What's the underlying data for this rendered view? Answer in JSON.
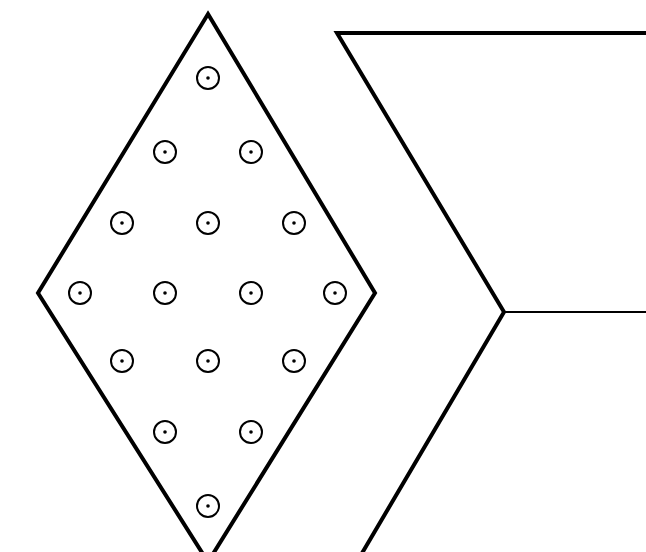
{
  "canvas": {
    "width": 646,
    "height": 552,
    "background": "#ffffff"
  },
  "colors": {
    "stroke": "#000000",
    "fill": "#ffffff"
  },
  "diamond": {
    "vertices": [
      [
        208,
        14
      ],
      [
        375,
        293
      ],
      [
        208,
        562
      ],
      [
        38,
        293
      ]
    ],
    "stroke_width": 4
  },
  "chevron": {
    "outer_path": [
      [
        646,
        33
      ],
      [
        337,
        33
      ],
      [
        504,
        312
      ],
      [
        358,
        560
      ]
    ],
    "stroke_width": 4,
    "divider": {
      "from": [
        504,
        312
      ],
      "to": [
        646,
        312
      ],
      "stroke_width": 2
    }
  },
  "circles": {
    "radius": 11,
    "dot_radius": 1.8,
    "stroke_width": 2,
    "positions": [
      [
        208,
        78
      ],
      [
        165,
        152
      ],
      [
        251,
        152
      ],
      [
        122,
        223
      ],
      [
        208,
        223
      ],
      [
        294,
        223
      ],
      [
        80,
        293
      ],
      [
        165,
        293
      ],
      [
        251,
        293
      ],
      [
        335,
        293
      ],
      [
        122,
        361
      ],
      [
        208,
        361
      ],
      [
        294,
        361
      ],
      [
        165,
        432
      ],
      [
        251,
        432
      ],
      [
        208,
        506
      ]
    ]
  }
}
